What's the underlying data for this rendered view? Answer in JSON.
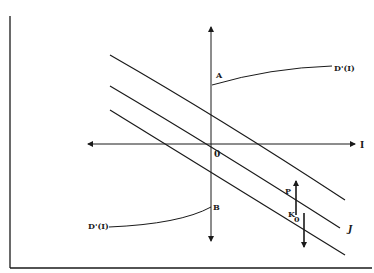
{
  "diagram": {
    "type": "economic-diagram",
    "axes": {
      "horizontal_label": "I",
      "origin_label": "0",
      "vertical_axis_has_label": false
    },
    "points": [
      {
        "id": "A",
        "label": "A",
        "position": "positive vertical axis intercept"
      },
      {
        "id": "B",
        "label": "B",
        "position": "negative vertical axis intercept"
      }
    ],
    "curves": [
      {
        "id": "upper-curve",
        "label": "",
        "description": "top downward-sloping curve"
      },
      {
        "id": "middle-curve",
        "label": "J",
        "description": "middle downward-sloping curve"
      },
      {
        "id": "lower-curve",
        "label": "",
        "description": "bottom downward-sloping curve"
      }
    ],
    "callouts": [
      {
        "id": "callout-upper",
        "label": "D'(I)",
        "points_to": "A"
      },
      {
        "id": "callout-lower",
        "label": "D'(I)",
        "points_to": "B"
      }
    ],
    "gaps": [
      {
        "id": "gap-p",
        "label": "P",
        "direction": "up",
        "between": [
          "middle-curve",
          "upper-curve"
        ]
      },
      {
        "id": "gap-k0",
        "label": "K",
        "subscript": "0",
        "direction": "down",
        "between": [
          "middle-curve",
          "lower-curve"
        ]
      }
    ],
    "colors": {
      "ink": "#1a1a1a",
      "background": "#ffffff"
    }
  }
}
